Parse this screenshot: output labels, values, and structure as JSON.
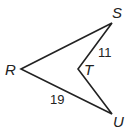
{
  "diagram": {
    "type": "concave quadrilateral (kite-like dart)",
    "points": {
      "R": {
        "label": "R",
        "x": 21,
        "y": 69
      },
      "S": {
        "label": "S",
        "x": 112,
        "y": 23
      },
      "T": {
        "label": "T",
        "x": 78,
        "y": 69
      },
      "U": {
        "label": "U",
        "x": 112,
        "y": 114
      }
    },
    "segments": [
      {
        "from": "R",
        "to": "S"
      },
      {
        "from": "S",
        "to": "T",
        "length_label": "11"
      },
      {
        "from": "T",
        "to": "U"
      },
      {
        "from": "U",
        "to": "R",
        "length_label": "19"
      }
    ],
    "labels": {
      "R": "R",
      "S": "S",
      "T": "T",
      "U": "U",
      "ST": "11",
      "RU": "19"
    },
    "stroke_color": "#222222"
  }
}
